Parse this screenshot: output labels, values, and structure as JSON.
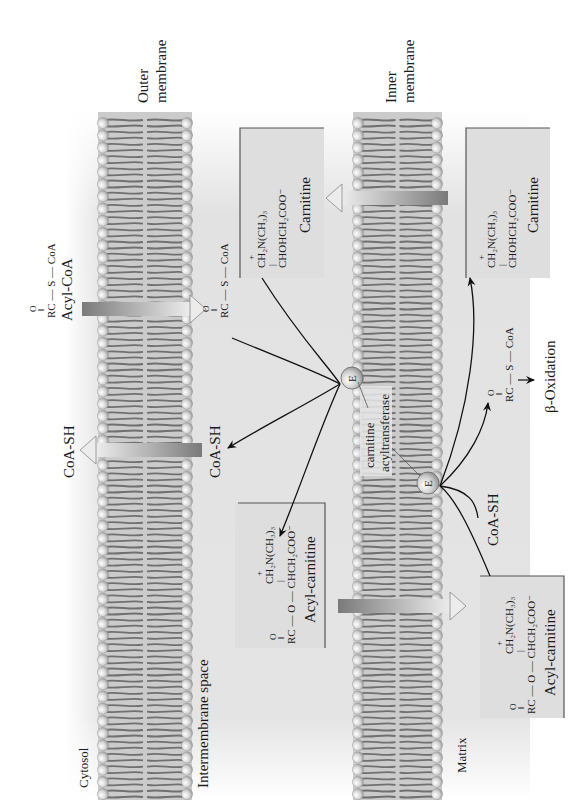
{
  "orientation": "rotated 90 degrees counter-clockwise",
  "regions": {
    "cytosol": "Cytosol",
    "intermembrane": "Intermembrane space",
    "matrix": "Matrix"
  },
  "membranes": {
    "outer": {
      "line1": "Outer",
      "line2": "membrane"
    },
    "inner": {
      "line1": "Inner",
      "line2": "membrane"
    }
  },
  "molecules": {
    "acyl_coa_cytosol": {
      "oxygen": "O",
      "formula": "RC — S — CoA",
      "name": "Acyl-CoA"
    },
    "acyl_coa_ims": {
      "oxygen": "O",
      "formula": "RC — S — CoA"
    },
    "coash_cytosol": "CoA-SH",
    "coash_ims": "CoA-SH",
    "coash_matrix": "CoA-SH",
    "carnitine_ims": {
      "line1": "CH₂N(CH₃)₃",
      "plus": "+",
      "bond": "|",
      "line2": "CHOHCH₂COO⁻",
      "name": "Carnitine"
    },
    "carnitine_matrix": {
      "line1": "CH₂N(CH₃)₃",
      "plus": "+",
      "bond": "|",
      "line2": "CHOHCH₂COO⁻",
      "name": "Carnitine"
    },
    "acylcarnitine_ims": {
      "oxygen": "O",
      "line1": "CH₂N(CH₃)₃",
      "plus": "+",
      "bond": "|",
      "line2": "RC — O — CHCH₂COO⁻",
      "name": "Acyl-carnitine"
    },
    "acylcarnitine_matrix": {
      "oxygen": "O",
      "line1": "CH₂N(CH₃)₃",
      "plus": "+",
      "bond": "|",
      "line2": "RC — O — CHCH₂COO⁻",
      "name": "Acyl-carnitine"
    },
    "acyl_coa_matrix": {
      "oxygen": "O",
      "formula": "RC — S — CoA"
    },
    "beta_oxidation": "β-Oxidation"
  },
  "enzyme": {
    "symbol": "E",
    "label_line1": "carnitine",
    "label_line2": "acyltransferase"
  },
  "colors": {
    "background": "#ffffff",
    "region_shade": "#dcdcdc",
    "lipid_head": "#d0d0d0",
    "lipid_tail": "#6f6f6f",
    "membrane_fill": "#c9c9c9",
    "transport_arrow_dark": "#808080",
    "transport_arrow_light": "#e6e6e6",
    "box_fill": "#dedede",
    "box_border": "#555555",
    "arrow": "#111111"
  }
}
